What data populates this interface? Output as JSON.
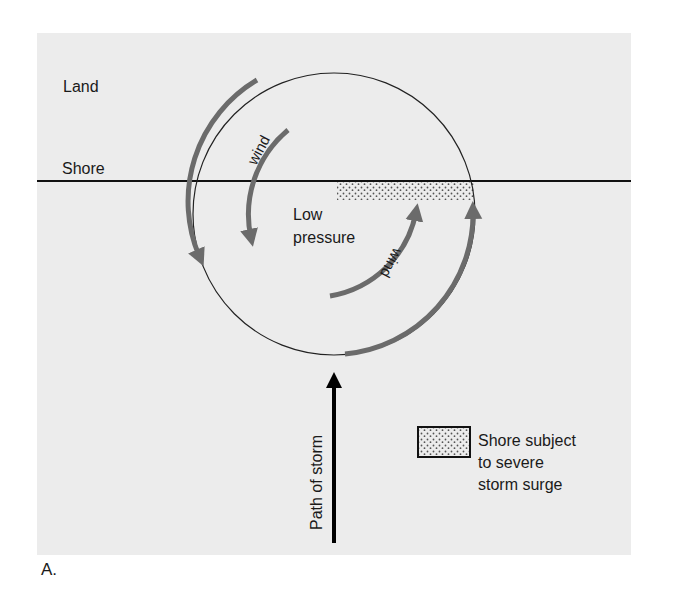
{
  "figure": {
    "caption": "A.",
    "labels": {
      "land": "Land",
      "shore": "Shore",
      "low_pressure_line1": "Low",
      "low_pressure_line2": "pressure",
      "wind_upper": "wind",
      "wind_lower": "wind",
      "path_of_storm": "Path of storm"
    },
    "legend": {
      "swatch": "stipple-pattern",
      "line1": "Shore subject",
      "line2": "to severe",
      "line3": "storm surge"
    },
    "colors": {
      "panel_background": "#ececec",
      "shore_line": "#111111",
      "circle": "#222222",
      "wind_arrows": "#6b6b6b",
      "storm_path_arrow": "#000000",
      "stipple_dot": "#555555"
    }
  }
}
